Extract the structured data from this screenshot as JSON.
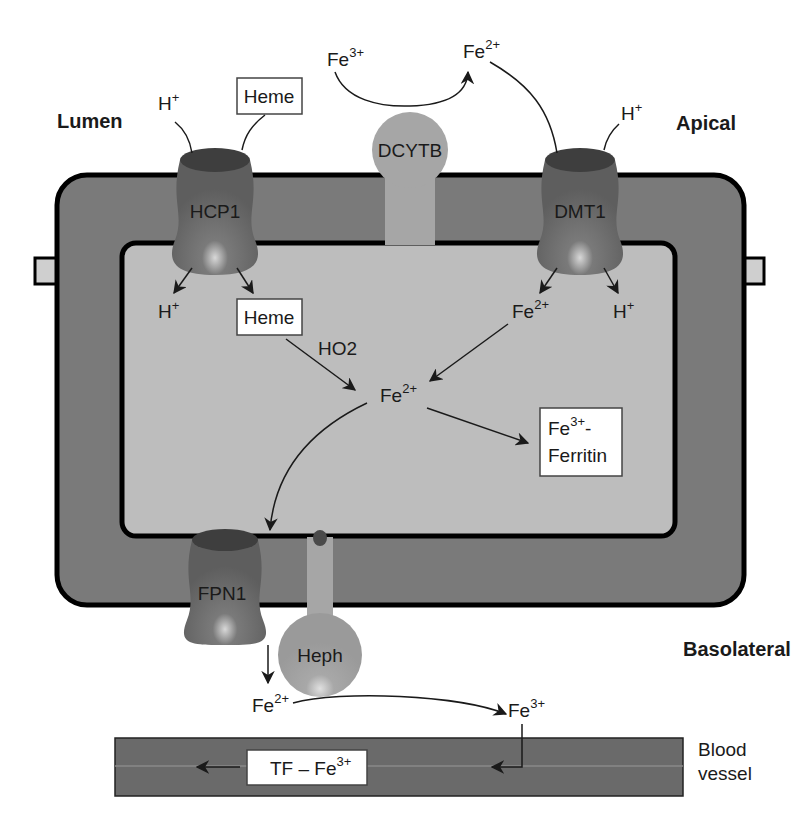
{
  "figure": {
    "regions": {
      "lumen": "Lumen",
      "apical": "Apical",
      "basolateral": "Basolateral",
      "blood_vessel_line1": "Blood",
      "blood_vessel_line2": "vessel"
    },
    "proteins": {
      "hcp1": "HCP1",
      "dcytb": "DCYTB",
      "dmt1": "DMT1",
      "fpn1": "FPN1",
      "heph": "Heph"
    },
    "species": {
      "fe_base": "Fe",
      "h_base": "H",
      "h_charge": "+",
      "fe2_charge": "2+",
      "fe3_charge": "3+"
    },
    "boxes": {
      "heme_lumen": "Heme",
      "heme_cell": "Heme",
      "ferritin_line1_base": "Fe",
      "ferritin_line1_charge": "3+",
      "ferritin_line1_suffix": "-",
      "ferritin_line2": "Ferritin",
      "tf_prefix": "TF – Fe",
      "tf_charge": "3+"
    },
    "enzymes": {
      "ho2": "HO2"
    },
    "colors": {
      "cell_outer": "#7a7a7a",
      "cell_inner": "#bdbdbd",
      "membrane_outline": "#000000",
      "transporter": "#6e6e6e",
      "transporter_top": "#3e3e3e",
      "dcytb_heph": "#a6a6a6",
      "blood_vessel": "#6a6a6a",
      "box_fill": "#ffffff"
    }
  }
}
